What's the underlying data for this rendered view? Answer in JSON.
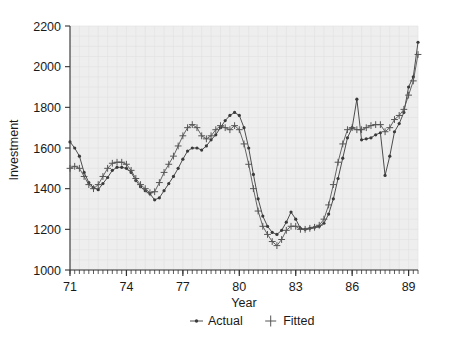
{
  "chart_data": {
    "type": "line",
    "title": "",
    "xlabel": "Year",
    "ylabel": "Investment",
    "xlim": [
      1971.0,
      1989.5
    ],
    "ylim": [
      1000,
      2200
    ],
    "ytick_values": [
      1000,
      1200,
      1400,
      1600,
      1800,
      2000,
      2200
    ],
    "ytick_labels": [
      "1000",
      "1200",
      "1400",
      "1600",
      "1800",
      "2000",
      "2200"
    ],
    "xtick_values": [
      71,
      74,
      77,
      80,
      83,
      86,
      89
    ],
    "xtick_labels": [
      "71",
      "74",
      "77",
      "80",
      "83",
      "86",
      "89"
    ],
    "minor_ticks": "quarterly",
    "grid": true,
    "legend_position": "bottom",
    "plot_bgcolor": "#eeeeee",
    "series": [
      {
        "name": "Actual",
        "marker": "dot",
        "color": "#3a3a3a",
        "x": [
          1971.0,
          1971.25,
          1971.5,
          1971.75,
          1972.0,
          1972.25,
          1972.5,
          1972.75,
          1973.0,
          1973.25,
          1973.5,
          1973.75,
          1974.0,
          1974.25,
          1974.5,
          1974.75,
          1975.0,
          1975.25,
          1975.5,
          1975.75,
          1976.0,
          1976.25,
          1976.5,
          1976.75,
          1977.0,
          1977.25,
          1977.5,
          1977.75,
          1978.0,
          1978.25,
          1978.5,
          1978.75,
          1979.0,
          1979.25,
          1979.5,
          1979.75,
          1980.0,
          1980.25,
          1980.5,
          1980.75,
          1981.0,
          1981.25,
          1981.5,
          1981.75,
          1982.0,
          1982.25,
          1982.5,
          1982.75,
          1983.0,
          1983.25,
          1983.5,
          1983.75,
          1984.0,
          1984.25,
          1984.5,
          1984.75,
          1985.0,
          1985.25,
          1985.5,
          1985.75,
          1986.0,
          1986.25,
          1986.5,
          1986.75,
          1987.0,
          1987.25,
          1987.5,
          1987.75,
          1988.0,
          1988.25,
          1988.5,
          1988.75,
          1989.0,
          1989.25,
          1989.5
        ],
        "y": [
          1630,
          1600,
          1560,
          1480,
          1430,
          1405,
          1395,
          1425,
          1455,
          1490,
          1505,
          1505,
          1500,
          1480,
          1440,
          1410,
          1390,
          1375,
          1345,
          1355,
          1390,
          1425,
          1460,
          1500,
          1545,
          1585,
          1600,
          1600,
          1590,
          1610,
          1640,
          1665,
          1700,
          1735,
          1760,
          1775,
          1760,
          1700,
          1600,
          1470,
          1350,
          1265,
          1215,
          1185,
          1175,
          1195,
          1235,
          1285,
          1250,
          1205,
          1200,
          1205,
          1210,
          1215,
          1230,
          1275,
          1350,
          1450,
          1550,
          1650,
          1700,
          1840,
          1640,
          1645,
          1650,
          1665,
          1675,
          1465,
          1560,
          1680,
          1720,
          1775,
          1900,
          1950,
          2120
        ]
      },
      {
        "name": "Fitted",
        "marker": "plus",
        "color": "#555555",
        "x": [
          1971.0,
          1971.25,
          1971.5,
          1971.75,
          1972.0,
          1972.25,
          1972.5,
          1972.75,
          1973.0,
          1973.25,
          1973.5,
          1973.75,
          1974.0,
          1974.25,
          1974.5,
          1974.75,
          1975.0,
          1975.25,
          1975.5,
          1975.75,
          1976.0,
          1976.25,
          1976.5,
          1976.75,
          1977.0,
          1977.25,
          1977.5,
          1977.75,
          1978.0,
          1978.25,
          1978.5,
          1978.75,
          1979.0,
          1979.25,
          1979.5,
          1979.75,
          1980.0,
          1980.25,
          1980.5,
          1980.75,
          1981.0,
          1981.25,
          1981.5,
          1981.75,
          1982.0,
          1982.25,
          1982.5,
          1982.75,
          1983.0,
          1983.25,
          1983.5,
          1983.75,
          1984.0,
          1984.25,
          1984.5,
          1984.75,
          1985.0,
          1985.25,
          1985.5,
          1985.75,
          1986.0,
          1986.25,
          1986.5,
          1986.75,
          1987.0,
          1987.25,
          1987.5,
          1987.75,
          1988.0,
          1988.25,
          1988.5,
          1988.75,
          1989.0,
          1989.25,
          1989.5
        ],
        "y": [
          1500,
          1510,
          1500,
          1460,
          1420,
          1400,
          1420,
          1460,
          1500,
          1525,
          1530,
          1530,
          1520,
          1490,
          1450,
          1420,
          1400,
          1380,
          1385,
          1430,
          1480,
          1520,
          1560,
          1610,
          1660,
          1700,
          1715,
          1700,
          1660,
          1645,
          1660,
          1690,
          1710,
          1700,
          1690,
          1710,
          1690,
          1620,
          1520,
          1400,
          1290,
          1215,
          1175,
          1140,
          1120,
          1150,
          1195,
          1215,
          1215,
          1200,
          1200,
          1205,
          1210,
          1220,
          1250,
          1320,
          1420,
          1530,
          1620,
          1690,
          1700,
          1690,
          1690,
          1700,
          1710,
          1715,
          1715,
          1680,
          1700,
          1740,
          1760,
          1790,
          1860,
          1930,
          2060
        ]
      }
    ]
  },
  "legend": {
    "items": [
      {
        "label": "Actual",
        "marker": "dot"
      },
      {
        "label": "Fitted",
        "marker": "plus"
      }
    ]
  }
}
